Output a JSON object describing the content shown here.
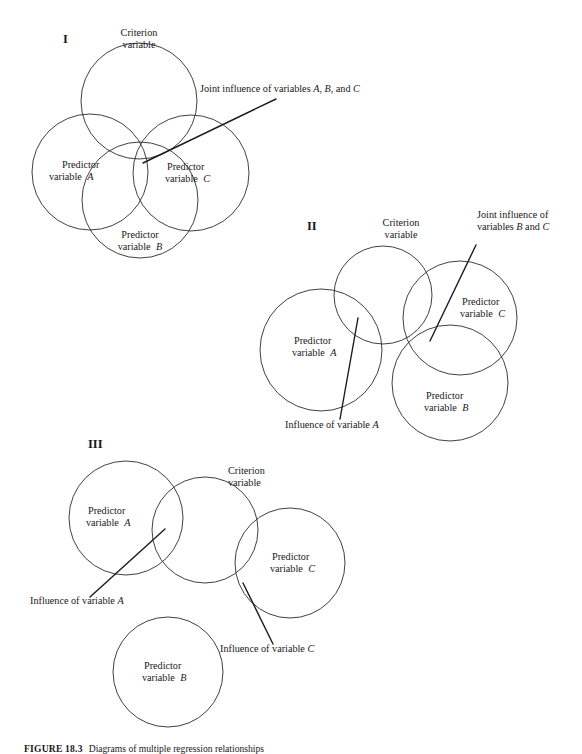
{
  "figure": {
    "caption_label": "FIGURE 18.3",
    "caption_text": "Diagrams of multiple regression relationships",
    "panels": [
      {
        "id": "I",
        "numeral": "I",
        "circles": [
          {
            "name": "criterion",
            "label_line1": "Criterion",
            "label_line2": "variable",
            "cx": 139,
            "cy": 101,
            "r": 58
          },
          {
            "name": "predictor-a",
            "label_line1": "Predictor",
            "label_line2": "variable",
            "label_italic": "A",
            "cx": 90,
            "cy": 172,
            "r": 58
          },
          {
            "name": "predictor-c",
            "label_line1": "Predictor",
            "label_line2": "variable",
            "label_italic": "C",
            "cx": 191,
            "cy": 173,
            "r": 58
          },
          {
            "name": "predictor-b",
            "label_line1": "Predictor",
            "label_line2": "variable",
            "label_italic": "B",
            "cx": 140,
            "cy": 200,
            "r": 58
          }
        ],
        "annotations": [
          {
            "name": "joint-influence-abc",
            "text_plain_1": "Joint influence of variables ",
            "text_italic_1": "A",
            "text_plain_2": ", ",
            "text_italic_2": "B",
            "text_plain_3": ", and ",
            "text_italic_3": "C",
            "text_x": 200,
            "text_y": 92,
            "line": {
              "x1": 276,
              "y1": 99,
              "x2": 143,
              "y2": 163
            }
          }
        ]
      },
      {
        "id": "II",
        "numeral": "II",
        "circles": [
          {
            "name": "criterion",
            "label_line1": "Criterion",
            "label_line2": "variable",
            "cx": 383,
            "cy": 295,
            "r": 49
          },
          {
            "name": "predictor-a",
            "label_line1": "Predictor",
            "label_line2": "variable",
            "label_italic": "A",
            "cx": 321,
            "cy": 350,
            "r": 61
          },
          {
            "name": "predictor-c",
            "label_line1": "Predictor",
            "label_line2": "variable",
            "label_italic": "C",
            "cx": 460,
            "cy": 318,
            "r": 57
          },
          {
            "name": "predictor-b",
            "label_line1": "Predictor",
            "label_line2": "variable",
            "label_italic": "B",
            "cx": 450,
            "cy": 383,
            "r": 58
          }
        ],
        "annotations": [
          {
            "name": "joint-influence-bc",
            "text_plain_1": "Joint influence of",
            "text_line2_plain_1": "variables ",
            "text_line2_italic_1": "B",
            "text_line2_plain_2": " and ",
            "text_line2_italic_2": "C",
            "text_x": 477,
            "text_y": 218,
            "line": {
              "x1": 476,
              "y1": 245,
              "x2": 430,
              "y2": 341
            }
          },
          {
            "name": "influence-a",
            "text_plain_1": "Influence of variable ",
            "text_italic_1": "A",
            "text_x": 285,
            "text_y": 428,
            "line": {
              "x1": 340,
              "y1": 419,
              "x2": 358,
              "y2": 318
            }
          }
        ]
      },
      {
        "id": "III",
        "numeral": "III",
        "circles": [
          {
            "name": "predictor-a",
            "label_line1": "Predictor",
            "label_line2": "variable",
            "label_italic": "A",
            "cx": 126,
            "cy": 518,
            "r": 57
          },
          {
            "name": "criterion",
            "label_line1": "Criterion",
            "label_line2": "variable",
            "cx": 205,
            "cy": 530,
            "r": 53
          },
          {
            "name": "predictor-c",
            "label_line1": "Predictor",
            "label_line2": "variable",
            "label_italic": "C",
            "cx": 290,
            "cy": 563,
            "r": 55
          },
          {
            "name": "predictor-b",
            "label_line1": "Predictor",
            "label_line2": "variable",
            "label_italic": "B",
            "cx": 168,
            "cy": 672,
            "r": 55
          }
        ],
        "annotations": [
          {
            "name": "influence-a",
            "text_plain_1": "Influence of variable ",
            "text_italic_1": "A",
            "text_x": 30,
            "text_y": 604,
            "line": {
              "x1": 90,
              "y1": 597,
              "x2": 165,
              "y2": 529
            }
          },
          {
            "name": "influence-c",
            "text_plain_1": "Influence of variable ",
            "text_italic_1": "C",
            "text_x": 220,
            "text_y": 652,
            "line": {
              "x1": 273,
              "y1": 644,
              "x2": 243,
              "y2": 583
            }
          }
        ]
      }
    ],
    "numeral_positions": [
      {
        "id": "I",
        "x": 63,
        "y": 43
      },
      {
        "id": "II",
        "x": 307,
        "y": 230
      },
      {
        "id": "III",
        "x": 88,
        "y": 448
      }
    ],
    "colors": {
      "stroke": "#2b2b2b",
      "text": "#18181a",
      "pointer": "#1c1c1c",
      "background": "#ffffff"
    }
  }
}
